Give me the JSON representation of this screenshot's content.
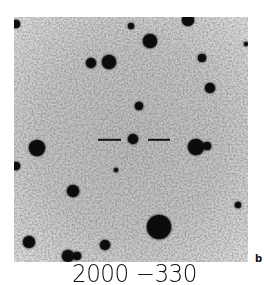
{
  "figure": {
    "field_name": "2000 −330",
    "panel_label": "b",
    "photo": {
      "x": 14,
      "y": 17,
      "width": 234,
      "height": 245,
      "background_color": "#c2c2c2",
      "ink_color": "#0c0c0c"
    },
    "marker": {
      "target": {
        "x": 133,
        "y": 139,
        "r": 5
      },
      "dashes": [
        {
          "x1": 98,
          "x2": 121,
          "y": 140
        },
        {
          "x1": 148,
          "x2": 170,
          "y": 140
        }
      ]
    },
    "stars": [
      {
        "x": 16,
        "y": 24,
        "r": 4
      },
      {
        "x": 131,
        "y": 26,
        "r": 3
      },
      {
        "x": 188,
        "y": 20,
        "r": 6
      },
      {
        "x": 150,
        "y": 41,
        "r": 7
      },
      {
        "x": 246,
        "y": 44,
        "r": 2
      },
      {
        "x": 91,
        "y": 63,
        "r": 5
      },
      {
        "x": 109,
        "y": 62,
        "r": 7
      },
      {
        "x": 202,
        "y": 58,
        "r": 4
      },
      {
        "x": 210,
        "y": 88,
        "r": 5
      },
      {
        "x": 139,
        "y": 106,
        "r": 4
      },
      {
        "x": 37,
        "y": 148,
        "r": 8
      },
      {
        "x": 196,
        "y": 147,
        "r": 8
      },
      {
        "x": 207,
        "y": 146,
        "r": 4
      },
      {
        "x": 16,
        "y": 166,
        "r": 4
      },
      {
        "x": 116,
        "y": 170,
        "r": 2
      },
      {
        "x": 73,
        "y": 191,
        "r": 6
      },
      {
        "x": 238,
        "y": 205,
        "r": 3
      },
      {
        "x": 159,
        "y": 227,
        "r": 12
      },
      {
        "x": 29,
        "y": 242,
        "r": 6
      },
      {
        "x": 105,
        "y": 245,
        "r": 5
      },
      {
        "x": 68,
        "y": 256,
        "r": 6
      },
      {
        "x": 77,
        "y": 256,
        "r": 4
      }
    ]
  }
}
